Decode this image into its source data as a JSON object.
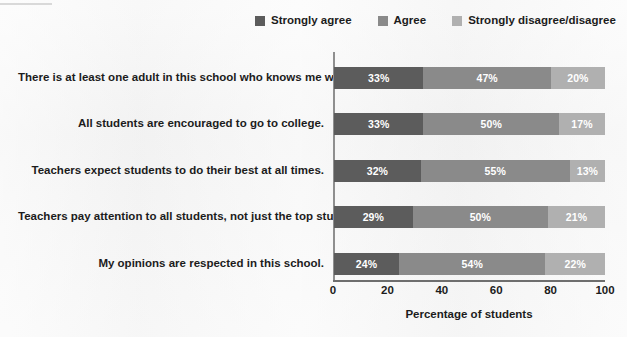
{
  "chart_data": {
    "type": "bar",
    "orientation": "horizontal",
    "stacked": true,
    "stack_total": 100,
    "title": "",
    "xlabel": "Percentage of students",
    "ylabel": "",
    "xlim": [
      0,
      100
    ],
    "xticks": [
      0,
      20,
      40,
      60,
      80,
      100
    ],
    "xtick_labels": [
      "0",
      "20",
      "40",
      "60",
      "80",
      "100"
    ],
    "grid": false,
    "legend_position": "top",
    "categories": [
      "There is at least one adult in this school who knows me well.",
      "All students are encouraged to go to college.",
      "Teachers expect students to do their best at all times.",
      "Teachers pay attention to all students, not just the top students.",
      "My opinions are respected in this school."
    ],
    "series": [
      {
        "name": "Strongly agree",
        "color": "#5c5c5c",
        "values": [
          33,
          33,
          32,
          29,
          24
        ],
        "labels": [
          "33%",
          "33%",
          "32%",
          "29%",
          "24%"
        ]
      },
      {
        "name": "Agree",
        "color": "#8a8a8a",
        "values": [
          47,
          50,
          55,
          50,
          54
        ],
        "labels": [
          "47%",
          "50%",
          "55%",
          "50%",
          "54%"
        ]
      },
      {
        "name": "Strongly disagree/disagree",
        "color": "#b0b0b0",
        "values": [
          20,
          17,
          13,
          21,
          22
        ],
        "labels": [
          "20%",
          "17%",
          "13%",
          "21%",
          "22%"
        ]
      }
    ]
  },
  "legend": {
    "items": [
      {
        "label": "Strongly agree",
        "color": "#5c5c5c"
      },
      {
        "label": "Agree",
        "color": "#8a8a8a"
      },
      {
        "label": "Strongly disagree/disagree",
        "color": "#b0b0b0"
      }
    ]
  },
  "axis": {
    "x_label": "Percentage of students"
  }
}
